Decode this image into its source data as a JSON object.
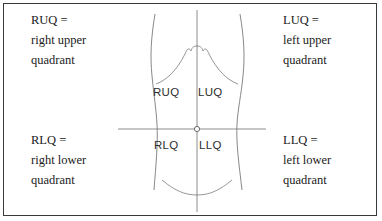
{
  "figure": {
    "background_color": "#ffffff",
    "border_color": "#3a3a3a",
    "line_color": "#6e6e6e",
    "text_color": "#1b1b1b"
  },
  "legends": {
    "upper_right_quadrant": {
      "abbreviation_line": "RUQ =",
      "name_line_1": "right upper",
      "name_line_2": "quadrant"
    },
    "upper_left_quadrant": {
      "abbreviation_line": "LUQ =",
      "name_line_1": "left upper",
      "name_line_2": "quadrant"
    },
    "lower_right_quadrant": {
      "abbreviation_line": "RLQ =",
      "name_line_1": "right lower",
      "name_line_2": "quadrant"
    },
    "lower_left_quadrant": {
      "abbreviation_line": "LLQ =",
      "name_line_1": "left lower",
      "name_line_2": "quadrant"
    }
  },
  "torso_labels": {
    "ruq": "RUQ",
    "luq": "LUQ",
    "rlq": "RLQ",
    "llq": "LLQ"
  },
  "anatomy": {
    "umbilicus_marker": "navel-circle",
    "vertical_axis": "median-plane-line",
    "horizontal_axis": "transumbilical-plane-line",
    "rib_outline": "costal-margin-curve",
    "pelvis_outline": "inguinal-groin-curve"
  }
}
